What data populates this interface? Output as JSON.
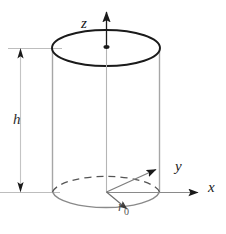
{
  "figure": {
    "type": "geometry-diagram",
    "shape": "cylinder",
    "background_color": "#ffffff",
    "line_color": "#1a1a1a",
    "thin_line_color": "#9a9a9a",
    "dashed_line_color": "#6b6b6b"
  },
  "axes": {
    "z": {
      "label": "z",
      "direction": "up",
      "arrow": true,
      "origin": {
        "x": 106,
        "y": 192
      },
      "tip": {
        "x": 106,
        "y": 8
      }
    },
    "y": {
      "label": "y",
      "direction": "upper-right",
      "arrow": true,
      "origin": {
        "x": 106,
        "y": 192
      },
      "tip": {
        "x": 163,
        "y": 166
      }
    },
    "x": {
      "label": "x",
      "direction": "right",
      "arrow": true,
      "origin": {
        "x": 106,
        "y": 192
      },
      "tip": {
        "x": 206,
        "y": 192
      }
    }
  },
  "dimensions": {
    "height": {
      "label": "h",
      "style": "double-headed-arrow",
      "orientation": "vertical",
      "line_x": 20,
      "top_y": 48,
      "bottom_y": 192,
      "label_pos": {
        "x": 13,
        "y": 122
      }
    },
    "radius": {
      "label_letter": "r",
      "label_subscript": "0",
      "style": "single-arrow",
      "from": {
        "x": 106,
        "y": 192
      },
      "to": {
        "x": 131,
        "y": 213
      },
      "label_pos": {
        "x": 119,
        "y": 212
      }
    }
  },
  "cylinder": {
    "center_x": 106,
    "left_x": 52,
    "right_x": 159,
    "top_center_y": 48,
    "bottom_center_y": 192,
    "ellipse_rx": 54,
    "ellipse_ry": 18,
    "top_face": "solid-ellipse",
    "bottom_face_front": "solid-arc",
    "bottom_face_back": "dashed-arc",
    "axis_marker": "center-dot"
  },
  "guides": {
    "top_extension_line": {
      "x1": 8,
      "y1": 48,
      "x2": 60,
      "y2": 48
    },
    "bottom_extension_line": {
      "x1": 0,
      "y1": 192,
      "x2": 60,
      "y2": 192
    }
  }
}
